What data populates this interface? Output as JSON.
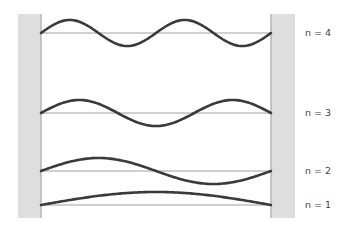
{
  "colors": {
    "wall_fill": "#dedede",
    "wall_edge": "#a8a8a8",
    "baseline": "#a0a0a0",
    "wave": "#3a3a3a",
    "label": "#444444"
  },
  "walls": {
    "left": {
      "x": 18,
      "y": 14,
      "width": 23,
      "height": 204
    },
    "right": {
      "x": 271,
      "y": 14,
      "width": 24,
      "height": 204
    }
  },
  "string": {
    "x_start": 41,
    "x_end": 271,
    "amplitude": 13
  },
  "modes": [
    {
      "n": 4,
      "label": "n = 4",
      "baseline_y": 33,
      "label_y": 36
    },
    {
      "n": 3,
      "label": "n = 3",
      "baseline_y": 113,
      "label_y": 116
    },
    {
      "n": 2,
      "label": "n = 2",
      "baseline_y": 171,
      "label_y": 174
    },
    {
      "n": 1,
      "label": "n = 1",
      "baseline_y": 205,
      "label_y": 208
    }
  ],
  "label_x": 305
}
